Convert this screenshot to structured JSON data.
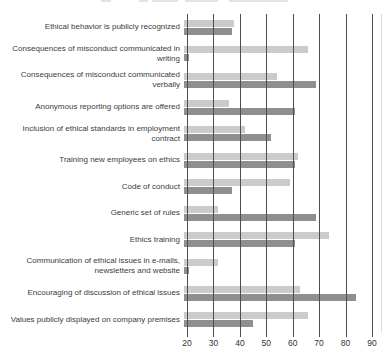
{
  "chart_data": {
    "type": "bar",
    "orientation": "horizontal",
    "title": "",
    "xlabel": "",
    "ylabel": "",
    "xlim": [
      20,
      90
    ],
    "x_ticks": [
      20,
      30,
      40,
      50,
      60,
      70,
      80,
      90
    ],
    "grid": true,
    "legend_visible": false,
    "categories": [
      "Ethical behavior is publicly recognized",
      "Consequences of misconduct communicated in\nwriting",
      "Consequences of misconduct communicated\nverbally",
      "Anonymous reporting options are offered",
      "Inclusion of ethical standards in employment\ncontract",
      "Training new employees on ethics",
      "Code of conduct",
      "Generic set of rules",
      "Ethics training",
      "Communication of ethical issues in e-mails,\nnewsletters and website",
      "Encouraging of discussion of ethical issues",
      "Values publicly displayed on company premises"
    ],
    "series": [
      {
        "name": "series-light-gray",
        "color": "#cbcbcb",
        "values": [
          39,
          67,
          55,
          37,
          43,
          63,
          60,
          33,
          75,
          33,
          64,
          67
        ]
      },
      {
        "name": "series-dark-gray",
        "color": "#8f8f8f",
        "values": [
          38,
          22,
          70,
          62,
          53,
          62,
          38,
          70,
          62,
          22,
          85,
          46
        ]
      }
    ],
    "colors": {
      "gridline": "#4d4d4d",
      "label_text": "#3c3c3c",
      "tick_text": "#333333"
    }
  }
}
